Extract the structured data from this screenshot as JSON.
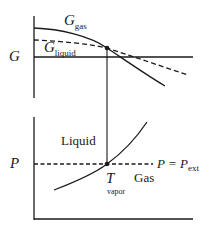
{
  "diagram": {
    "top_panel": {
      "axis_label": "G",
      "curves": [
        {
          "name": "G_gas",
          "label_main": "G",
          "label_sub": "gas",
          "style": "solid"
        },
        {
          "name": "G_liquid",
          "label_main": "G",
          "label_sub": "liquid",
          "style": "dashed"
        }
      ]
    },
    "bottom_panel": {
      "axis_label": "P",
      "region_liquid": "Liquid",
      "region_gas": "Gas",
      "pressure_line_label_main": "P = P",
      "pressure_line_label_sub": "ext",
      "intersection_label_main": "T",
      "intersection_label_sub": "vapor"
    },
    "colors": {
      "line": "#1a1a1a",
      "background": "#ffffff"
    }
  }
}
